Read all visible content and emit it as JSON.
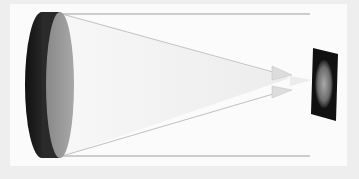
{
  "diagram": {
    "title": "",
    "elements": {
      "lens": {
        "label": "",
        "rim_color": "#1e1e1e",
        "face_color": "#9a9a9a"
      },
      "parallel_rays": {
        "label": "",
        "color": "#bdbdbd"
      },
      "converging_beam": {
        "label": "",
        "color": "#d6d6d6"
      },
      "image_plate": {
        "label": "",
        "color": "#111111",
        "content": "earth-image"
      }
    },
    "colors": {
      "background": "#eeeeee",
      "panel": "#fbfbfb"
    }
  }
}
